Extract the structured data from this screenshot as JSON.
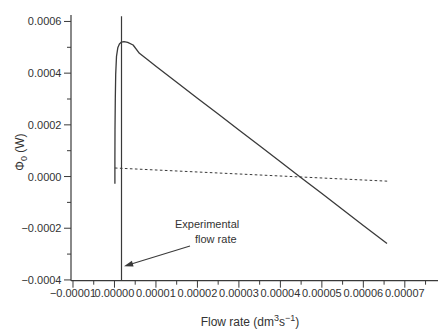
{
  "figure": {
    "y_title": {
      "symbol": "Φ",
      "subscript": "0",
      "rest": " (W)"
    },
    "x_title": {
      "p1": "Flow rate (dm",
      "sup1": "3",
      "p2": "s",
      "sup2": "−1",
      "p3": ")"
    },
    "annotation": {
      "line1": "Experimental",
      "line2": "flow rate"
    }
  },
  "chart_data": {
    "type": "line",
    "title": "",
    "xlabel": "Flow rate (dm3 s-1)",
    "ylabel": "Phi0 (W)",
    "xlim": [
      -1.048e-05,
      7.8e-05
    ],
    "ylim": [
      -0.000403,
      0.000625
    ],
    "grid": false,
    "legend": "none",
    "x_ticks": [
      -1e-05,
      0.0,
      1e-05,
      2e-05,
      3e-05,
      4e-05,
      5e-05,
      6e-05,
      7e-05
    ],
    "x_tick_labels": [
      "−0.00001",
      "0.00000",
      "0.00001",
      "0.00002",
      "0.00003",
      "0.00004",
      "0.00005",
      "0.00006",
      "0.00007"
    ],
    "x_minor_step": 5e-06,
    "y_ticks": [
      -0.0004,
      -0.0002,
      0.0,
      0.0002,
      0.0004,
      0.0006
    ],
    "y_tick_labels": [
      "−0.0004",
      "−0.0002",
      "0.0000",
      "0.0002",
      "0.0004",
      "0.0006"
    ],
    "y_minor_step": 0.0001,
    "axis_color": "#3a3a3a",
    "line_color": "#3a3a3a",
    "series": [
      {
        "name": "power-curve",
        "style": "solid",
        "stroke_width": 1.3,
        "points": [
          [
            1e-07,
            -2.8e-05
          ],
          [
            1.15e-07,
            6e-05
          ],
          [
            1.4e-07,
            0.00018
          ],
          [
            2e-07,
            0.0003
          ],
          [
            3e-07,
            0.000395
          ],
          [
            5e-07,
            0.000465
          ],
          [
            8e-07,
            0.000498
          ],
          [
            1.2e-06,
            0.000513
          ],
          [
            1.7e-06,
            0.00052
          ],
          [
            2.3e-06,
            0.000522
          ],
          [
            3.2e-06,
            0.000519
          ],
          [
            4.5e-06,
            0.000509
          ],
          [
            6e-06,
            0.000477
          ],
          [
            8e-06,
            0.000452
          ],
          [
            1e-05,
            0.000427
          ],
          [
            1.5e-05,
            0.000365
          ],
          [
            2e-05,
            0.000303
          ],
          [
            2.5e-05,
            0.000242
          ],
          [
            3e-05,
            0.00018
          ],
          [
            3.5e-05,
            0.000119
          ],
          [
            4e-05,
            5.7e-05
          ],
          [
            4.5e-05,
            -5e-06
          ],
          [
            5e-05,
            -6.6e-05
          ],
          [
            5.5e-05,
            -0.000128
          ],
          [
            6e-05,
            -0.000189
          ],
          [
            6.57e-05,
            -0.000259
          ]
        ]
      },
      {
        "name": "reference-line",
        "style": "dashed",
        "stroke_width": 1,
        "points": [
          [
            1e-07,
            3.3e-05
          ],
          [
            6.6e-05,
            -1.8e-05
          ]
        ]
      },
      {
        "name": "experimental-flow-rate-line",
        "style": "solid",
        "stroke_width": 1.2,
        "points": [
          [
            1.7e-06,
            -0.000403
          ],
          [
            1.7e-06,
            0.00062
          ]
        ]
      }
    ],
    "annotations": [
      {
        "text": "Experimental flow rate",
        "points_to_x": 1.7e-06
      }
    ]
  }
}
